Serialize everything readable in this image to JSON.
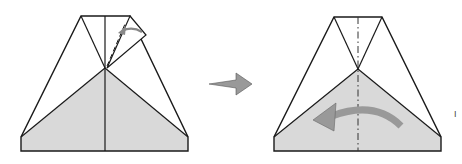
{
  "diagram": {
    "steps": [
      {
        "id": "before",
        "description": "Fold flap down along valley line",
        "fill": "#d8d8d8"
      },
      {
        "id": "after",
        "description": "Fold right half over to the left along center mountain line",
        "fill": "#d8d8d8"
      }
    ],
    "colors": {
      "line": "#1a1a1a",
      "shade": "#d9d9d9",
      "arrow": "#999999"
    },
    "margin_mark": "I"
  }
}
